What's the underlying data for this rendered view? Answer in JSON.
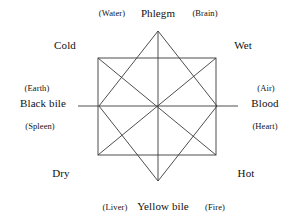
{
  "diagram": {
    "line_color": "#3a3a3a",
    "background_color": "#ffffff",
    "shape": "octagram formed by two overlapping squares with diagonals"
  },
  "labels": {
    "top": {
      "left_paren": "(Water)",
      "center": "Phlegm",
      "right_paren": "(Brain)"
    },
    "bottom": {
      "left_paren": "(Liver)",
      "center": "Yellow bile",
      "right_paren": "(Fire)"
    },
    "left": {
      "element_paren": "(Earth)",
      "humour": "Black bile",
      "organ_paren": "(Spleen)"
    },
    "right": {
      "element_paren": "(Air)",
      "humour": "Blood",
      "organ_paren": "(Heart)"
    },
    "qualities": {
      "top_left": "Cold",
      "top_right": "Wet",
      "bottom_left": "Dry",
      "bottom_right": "Hot"
    }
  }
}
